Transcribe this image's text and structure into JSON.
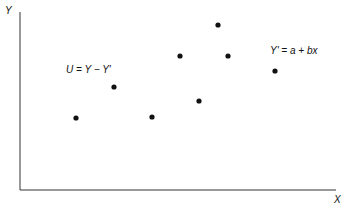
{
  "chart_data": {
    "type": "scatter",
    "title": "",
    "xlabel": "X",
    "ylabel": "Y",
    "grid": false,
    "legend": null,
    "points": [
      {
        "x": 76,
        "y": 118
      },
      {
        "x": 114,
        "y": 87
      },
      {
        "x": 152,
        "y": 117
      },
      {
        "x": 180,
        "y": 56
      },
      {
        "x": 199,
        "y": 101
      },
      {
        "x": 218,
        "y": 25
      },
      {
        "x": 228,
        "y": 56
      },
      {
        "x": 275,
        "y": 71
      }
    ],
    "annotations": [
      {
        "text": "U = Y − Y'",
        "x": 66,
        "y": 70
      },
      {
        "text": "Y' = a + bx",
        "x": 270,
        "y": 51
      }
    ]
  },
  "axes": {
    "x_label": "X",
    "y_label": "Y"
  },
  "annotations": {
    "residual": "U = Y − Y'",
    "regression": "Y' = a + bx"
  }
}
